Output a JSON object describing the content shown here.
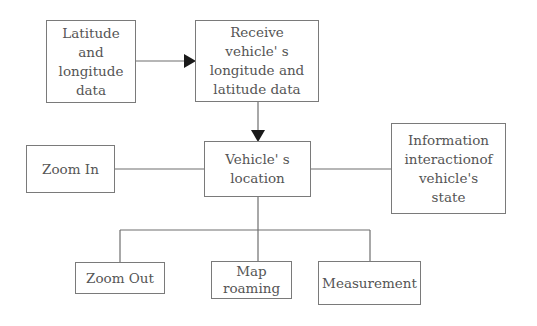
{
  "diagram": {
    "nodes": [
      {
        "id": "source",
        "label": "Latitude\nand\nlongitude\ndata"
      },
      {
        "id": "receive",
        "label": "Receive\nvehicle' s\nlongitude and\nlatitude data"
      },
      {
        "id": "location",
        "label": "Vehicle' s\nlocation"
      },
      {
        "id": "zoom_in",
        "label": "Zoom In"
      },
      {
        "id": "info",
        "label": "Information\ninteractionof\nvehicle's\nstate"
      },
      {
        "id": "zoom_out",
        "label": "Zoom Out"
      },
      {
        "id": "roaming",
        "label": "Map\nroaming"
      },
      {
        "id": "measurement",
        "label": "Measurement"
      }
    ],
    "edges": [
      {
        "from": "source",
        "to": "receive",
        "arrow": true
      },
      {
        "from": "receive",
        "to": "location",
        "arrow": true
      },
      {
        "from": "location",
        "to": "zoom_in",
        "arrow": false
      },
      {
        "from": "location",
        "to": "info",
        "arrow": false
      },
      {
        "from": "location",
        "to": "zoom_out",
        "arrow": false
      },
      {
        "from": "location",
        "to": "roaming",
        "arrow": false
      },
      {
        "from": "location",
        "to": "measurement",
        "arrow": false
      }
    ],
    "colors": {
      "line": "#6e6e6e",
      "text": "#555555",
      "arrow": "#1a1a1a"
    }
  }
}
